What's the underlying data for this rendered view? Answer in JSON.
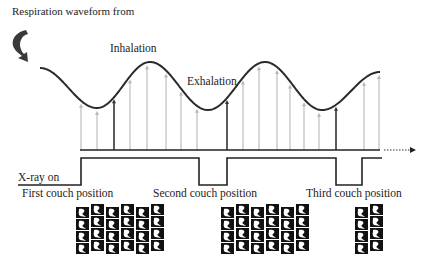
{
  "title": "Respiration waveform from",
  "labels": {
    "inhalation": "Inhalation",
    "exhalation": "Exhalation",
    "xray_on": "X-ray on",
    "first_couch": "First couch position",
    "second_couch": "Second couch position",
    "third_couch": "Third couch position"
  },
  "colors": {
    "waveform": "#2a2a2a",
    "arrow_light": "#b8b8b8",
    "arrow_dark": "#333333",
    "baseline": "#222222",
    "image_stack": "#111111"
  },
  "waveform": {
    "x_start": 40,
    "x_end": 380,
    "baseline_y": 150,
    "minima": [
      {
        "x": 97,
        "y": 108
      },
      {
        "x": 322,
        "y": 110
      }
    ],
    "maxima": [
      {
        "x": 150,
        "y": 62
      },
      {
        "x": 265,
        "y": 62
      }
    ]
  },
  "sampling_arrows": [
    {
      "x": 81,
      "type": "light"
    },
    {
      "x": 97,
      "type": "light"
    },
    {
      "x": 114,
      "type": "dark"
    },
    {
      "x": 130,
      "type": "light"
    },
    {
      "x": 147,
      "type": "light"
    },
    {
      "x": 166,
      "type": "light"
    },
    {
      "x": 181,
      "type": "light"
    },
    {
      "x": 197,
      "type": "light"
    },
    {
      "x": 227,
      "type": "dark"
    },
    {
      "x": 243,
      "type": "light"
    },
    {
      "x": 259,
      "type": "light"
    },
    {
      "x": 277,
      "type": "light"
    },
    {
      "x": 290,
      "type": "light"
    },
    {
      "x": 304,
      "type": "light"
    },
    {
      "x": 319,
      "type": "light"
    },
    {
      "x": 336,
      "type": "dark"
    },
    {
      "x": 364,
      "type": "light"
    },
    {
      "x": 379,
      "type": "light"
    }
  ],
  "xray_signal": {
    "low_y": 185,
    "high_y": 158,
    "segments": [
      [
        60,
        81
      ],
      [
        199,
        227
      ],
      [
        336,
        362
      ]
    ]
  },
  "image_groups": [
    {
      "x_start": 76,
      "count": 6
    },
    {
      "x_start": 221,
      "count": 6
    },
    {
      "x_start": 355,
      "count": 2
    }
  ]
}
